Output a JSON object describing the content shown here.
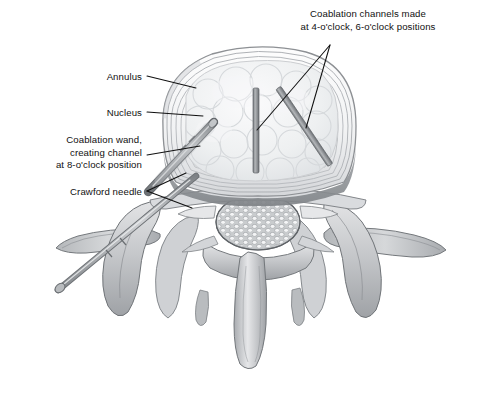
{
  "figure": {
    "background_color": "#ffffff",
    "width": 477,
    "height": 400
  },
  "palette": {
    "line": "#111111",
    "annulus_ring": "#b9bcc0",
    "annulus_fill": "#f4f5f6",
    "nucleus_fill": "#eceef0",
    "nucleus_lobule": "#dfe2e5",
    "disc_rim_dark": "#8e9296",
    "bone_fill": "#c8cacd",
    "bone_mid": "#a9acb0",
    "bone_light": "#e3e4e6",
    "bone_outline": "#6e7276",
    "cord_fill": "#d7d9dc",
    "cord_dot": "#f2f3f4",
    "channel_gray": "#9a9da1",
    "channel_dark": "#6f7377",
    "wand_gray": "#9b9ea2",
    "needle_gray": "#a5a8ac"
  },
  "labels": [
    {
      "id": "coablation-channels",
      "name": "label-coablation-channels",
      "lines": [
        "Coablation channels made",
        "at 4-o'clock, 6-o'clock positions"
      ],
      "text": "Coablation channels made\nat 4-o'clock, 6-o'clock positions",
      "align": "center",
      "x": 272,
      "y": 8,
      "width": 192
    },
    {
      "id": "annulus",
      "name": "label-annulus",
      "lines": [
        "Annulus"
      ],
      "text": "Annulus",
      "align": "right",
      "x": 18,
      "y": 71,
      "width": 124
    },
    {
      "id": "nucleus",
      "name": "label-nucleus",
      "lines": [
        "Nucleus"
      ],
      "text": "Nucleus",
      "align": "right",
      "x": 18,
      "y": 107,
      "width": 124
    },
    {
      "id": "coablation-wand",
      "name": "label-coablation-wand",
      "lines": [
        "Coablation wand,",
        "creating channel",
        "at 8-o'clock position"
      ],
      "text": "Coablation wand,\ncreating channel\nat 8-o'clock position",
      "align": "right",
      "x": 8,
      "y": 134,
      "width": 134
    },
    {
      "id": "crawford-needle",
      "name": "label-crawford-needle",
      "lines": [
        "Crawford needle"
      ],
      "text": "Crawford needle",
      "align": "right",
      "x": 18,
      "y": 186,
      "width": 124
    }
  ],
  "leader_lines": [
    {
      "name": "leader-annulus",
      "from": [
        147,
        76
      ],
      "to": [
        196,
        88
      ]
    },
    {
      "name": "leader-nucleus",
      "from": [
        147,
        112
      ],
      "to": [
        203,
        116
      ]
    },
    {
      "name": "leader-coablation-wand",
      "from": [
        147,
        155
      ],
      "to": [
        200,
        146
      ]
    },
    {
      "name": "leader-crawford-needle-a",
      "from": [
        147,
        191
      ],
      "to": [
        186,
        173
      ]
    },
    {
      "name": "leader-crawford-needle-b",
      "from": [
        147,
        191
      ],
      "to": [
        190,
        206
      ]
    },
    {
      "name": "leader-channel-6oclock",
      "from": [
        330,
        45
      ],
      "to": [
        257,
        130
      ]
    },
    {
      "name": "leader-channel-4oclock",
      "from": [
        330,
        45
      ],
      "to": [
        305,
        127
      ]
    }
  ],
  "anatomy": {
    "disc": {
      "name": "intervertebral-disc",
      "annulus_ring_count": 9,
      "description": "Concentric annulus fibrosus lamellae surrounding the nucleus pulposus"
    },
    "nucleus": {
      "name": "nucleus-pulposus",
      "description": "Lobular gelatinous nucleus with bubble texture"
    },
    "spinal_canal": {
      "name": "cauda-equina",
      "description": "Oval stippled bundle of nerve roots in spinal canal",
      "dot_rows": 7
    },
    "vertebra": {
      "name": "vertebral-arch",
      "parts": [
        "left-transverse-process",
        "right-transverse-process",
        "left-superior-articular-process",
        "right-superior-articular-process",
        "lamina",
        "spinous-process"
      ]
    }
  },
  "instruments": {
    "channels": [
      {
        "name": "channel-6-oclock",
        "clock_position": "6-o'clock",
        "x1": 256,
        "y1": 88,
        "x2": 256,
        "y2": 173,
        "thickness": 6
      },
      {
        "name": "channel-4-oclock",
        "clock_position": "4-o'clock",
        "x1": 278,
        "y1": 88,
        "x2": 330,
        "y2": 165,
        "thickness": 6
      }
    ],
    "coablation_wand": {
      "name": "coablation-wand",
      "clock_position": "8-o'clock",
      "tip": [
        212,
        124
      ],
      "heel": [
        150,
        190
      ],
      "thickness": 7
    },
    "crawford_needle": {
      "name": "crawford-needle",
      "tip": [
        196,
        178
      ],
      "hub": [
        60,
        288
      ],
      "thickness": 6
    }
  }
}
